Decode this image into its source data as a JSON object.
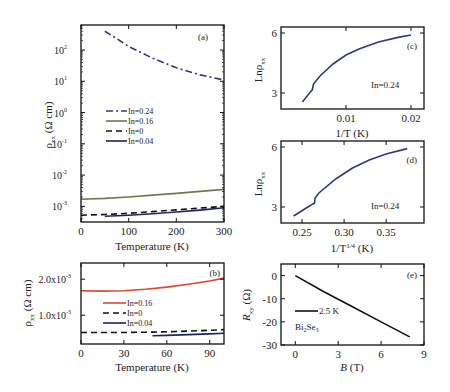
{
  "chart_data": [
    {
      "panel": "(a)",
      "type": "line",
      "xlabel": "Temperature (K)",
      "ylabel": "ρ_xx (Ω cm)",
      "yscale": "log",
      "xlim": [
        0,
        300
      ],
      "ylim_exp": [
        -3.5,
        2.8
      ],
      "xticks": [
        0,
        100,
        200,
        300
      ],
      "yticks_exp": [
        2,
        1,
        0,
        -1,
        -2,
        -3
      ],
      "legend": [
        "In=0.24",
        "In=0.16",
        "In=0",
        "In=0.04"
      ],
      "series": [
        {
          "name": "In=0.24",
          "color": "#2f3a7a",
          "dash": "7,3,2,3",
          "x": [
            50,
            75,
            100,
            150,
            200,
            250,
            300
          ],
          "y": [
            400,
            230,
            130,
            55,
            27,
            16,
            11
          ]
        },
        {
          "name": "In=0.16",
          "color": "#6f7a4e",
          "dash": "",
          "x": [
            0,
            50,
            100,
            150,
            200,
            250,
            300
          ],
          "y": [
            0.0017,
            0.0018,
            0.002,
            0.0023,
            0.0026,
            0.003,
            0.0035
          ]
        },
        {
          "name": "In=0",
          "color": "#111111",
          "dash": "6,4",
          "x": [
            0,
            50,
            100,
            150,
            200,
            250,
            300
          ],
          "y": [
            0.00052,
            0.00055,
            0.0006,
            0.00068,
            0.00077,
            0.00088,
            0.001
          ]
        },
        {
          "name": "In=0.04",
          "color": "#1e2460",
          "dash": "",
          "x": [
            50,
            100,
            150,
            200,
            250,
            300
          ],
          "y": [
            0.00048,
            0.00052,
            0.00058,
            0.00066,
            0.00076,
            0.0009
          ]
        }
      ]
    },
    {
      "panel": "(b)",
      "type": "line",
      "xlabel": "Temperature (K)",
      "ylabel": "ρ_xx (Ω cm)",
      "xlim": [
        0,
        100
      ],
      "ylim": [
        0.0002,
        0.00245
      ],
      "xticks": [
        0,
        30,
        60,
        90
      ],
      "yticks": [
        0.001,
        0.002
      ],
      "ytick_labels": [
        "1.0x10⁻³",
        "2.0x10⁻³"
      ],
      "legend": [
        "In=0.16",
        "In=0",
        "In=0.04"
      ],
      "series": [
        {
          "name": "In=0.16",
          "color": "#e0442c",
          "dash": "",
          "x": [
            0,
            15,
            30,
            45,
            60,
            75,
            90,
            100
          ],
          "y": [
            0.00168,
            0.00167,
            0.00168,
            0.00172,
            0.00178,
            0.00186,
            0.00195,
            0.00203
          ]
        },
        {
          "name": "In=0",
          "color": "#111111",
          "dash": "6,4",
          "x": [
            0,
            30,
            50,
            70,
            90,
            100
          ],
          "y": [
            0.00052,
            0.00052,
            0.00053,
            0.00055,
            0.00058,
            0.0006
          ]
        },
        {
          "name": "In=0.04",
          "color": "#1e2460",
          "dash": "",
          "x": [
            50,
            60,
            75,
            90,
            100
          ],
          "y": [
            0.00043,
            0.00044,
            0.00046,
            0.00048,
            0.0005
          ]
        }
      ]
    },
    {
      "panel": "(c)",
      "type": "line",
      "xlabel": "1/T (K)",
      "ylabel": "Lnρ_xx",
      "xlim": [
        0.0,
        0.022
      ],
      "ylim": [
        2.2,
        6.3
      ],
      "xticks": [
        0.01,
        0.02
      ],
      "yticks": [
        3,
        6
      ],
      "annotation": "In=0.24",
      "series": [
        {
          "name": "In=0.24",
          "color": "#2f3a7a",
          "x": [
            0.0033,
            0.0045,
            0.0048,
            0.005,
            0.006,
            0.008,
            0.01,
            0.012,
            0.015,
            0.018,
            0.02
          ],
          "y": [
            2.55,
            3.05,
            3.15,
            3.45,
            3.85,
            4.45,
            4.9,
            5.2,
            5.55,
            5.78,
            5.9
          ]
        }
      ]
    },
    {
      "panel": "(d)",
      "type": "line",
      "xlabel": "1/T^1/4 (K)",
      "ylabel": "Lnρ_xx",
      "xlim": [
        0.225,
        0.395
      ],
      "ylim": [
        2.2,
        6.3
      ],
      "xticks": [
        0.25,
        0.3,
        0.35
      ],
      "yticks": [
        3,
        6
      ],
      "annotation": "In=0.24",
      "series": [
        {
          "name": "In=0.24",
          "color": "#2f3a7a",
          "x": [
            0.24,
            0.255,
            0.265,
            0.2655,
            0.27,
            0.29,
            0.31,
            0.33,
            0.35,
            0.375
          ],
          "y": [
            2.55,
            2.95,
            3.2,
            3.45,
            3.7,
            4.4,
            4.95,
            5.35,
            5.65,
            5.92
          ]
        }
      ]
    },
    {
      "panel": "(e)",
      "type": "line",
      "xlabel": "B (T)",
      "ylabel": "R_xy (Ω)",
      "xlim": [
        -1,
        9
      ],
      "ylim": [
        -30,
        5
      ],
      "xticks": [
        0,
        3,
        6,
        9
      ],
      "yticks": [
        0,
        -10,
        -20,
        -30
      ],
      "legend": [
        "2.5 K"
      ],
      "annotation": "Bi2Se3",
      "series": [
        {
          "name": "2.5 K",
          "color": "#111111",
          "x": [
            0,
            2,
            4,
            6,
            8
          ],
          "y": [
            0,
            -7,
            -13.5,
            -20,
            -26.5
          ]
        }
      ]
    }
  ],
  "labels": {
    "a": {
      "tag": "(a)",
      "xlabel": "Temperature (K)",
      "ylabel": "ρ",
      "ysub": "xx",
      "yunit": " (Ω cm)"
    },
    "b": {
      "tag": "(b)",
      "xlabel": "Temperature (K)",
      "ylabel": "ρ",
      "ysub": "xx",
      "yunit": " (Ω cm)"
    },
    "c": {
      "tag": "(c)",
      "xlabel": "1/T (K)",
      "ylabel": "Lnρ",
      "ysub": "xx",
      "note": "In=0.24"
    },
    "d": {
      "tag": "(d)",
      "xlabel_pre": "1/T",
      "xlabel_sup": "1/4",
      "xlabel_post": " (K)",
      "ylabel": "Lnρ",
      "ysub": "xx",
      "note": "In=0.24"
    },
    "e": {
      "tag": "(e)",
      "xlabel_i": "B",
      "xlabel_post": " (T)",
      "ylabel": "R",
      "ysub": "xy",
      "yunit": " (Ω)",
      "legend": "2.5 K",
      "note_main": "Bi",
      "note_sub1": "2",
      "note_mid": "Se",
      "note_sub2": "3"
    }
  }
}
